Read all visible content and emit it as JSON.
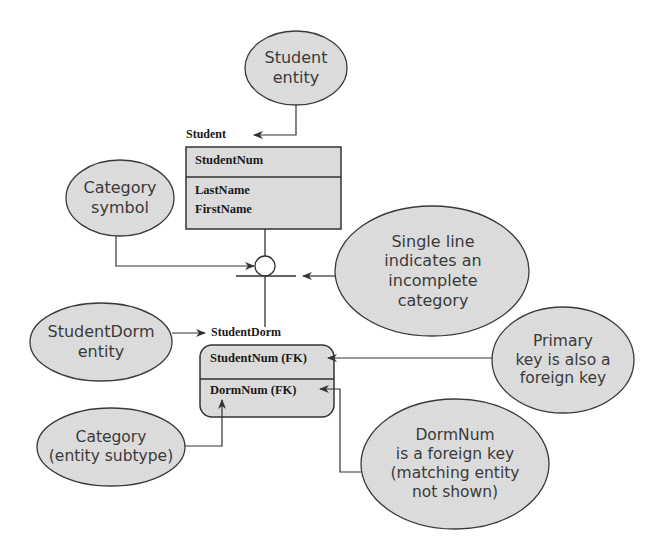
{
  "colors": {
    "bubble_fill": "#dcdcdc",
    "bubble_stroke": "#3a3a3a",
    "entity_fill": "#d9d9d9",
    "line": "#333333"
  },
  "entities": {
    "student": {
      "name": "Student",
      "key_attrs": [
        "StudentNum"
      ],
      "attrs": [
        "LastName",
        "FirstName"
      ]
    },
    "student_dorm": {
      "name": "StudentDorm",
      "key_attrs": [
        "StudentNum (FK)"
      ],
      "attrs": [
        "DormNum (FK)"
      ]
    }
  },
  "callouts": {
    "student_entity": [
      "Student",
      "entity"
    ],
    "category_symbol": [
      "Category",
      "symbol"
    ],
    "single_line": [
      "Single line",
      "indicates an",
      "incomplete",
      "category"
    ],
    "student_dorm_entity": [
      "StudentDorm",
      "entity"
    ],
    "primary_key": [
      "Primary",
      "key is also a",
      "foreign key"
    ],
    "category_subtype": [
      "Category",
      "(entity subtype)"
    ],
    "dormnum_fk": [
      "DormNum",
      "is a foreign key",
      "(matching entity",
      "not shown)"
    ]
  }
}
